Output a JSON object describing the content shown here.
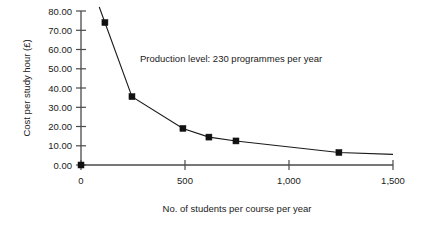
{
  "chart_data": {
    "type": "line",
    "title": "",
    "subtitle": "",
    "xlabel": "No. of students per course per year",
    "ylabel": "Cost per study hour (£)",
    "xlim": [
      0,
      1500
    ],
    "ylim": [
      0,
      80
    ],
    "grid": false,
    "legend": null,
    "annotations": [
      {
        "text": "Production level: 230 programmes per year",
        "x": 330,
        "y": 57
      }
    ],
    "xticks": [
      0,
      500,
      1000,
      1500
    ],
    "xticklabels": [
      "0",
      "500",
      "1,000",
      "1,500"
    ],
    "yticks": [
      0,
      10,
      20,
      30,
      40,
      50,
      60,
      70,
      80
    ],
    "yticklabels": [
      "0.00",
      "10.00",
      "20.00",
      "30.00",
      "40.00",
      "50.00",
      "60.00",
      "70.00",
      "80.00"
    ],
    "series": [
      {
        "name": "Cost per study hour",
        "marker": "square",
        "color": "#111111",
        "x": [
          0,
          115,
          245,
          490,
          615,
          745,
          1240,
          1500
        ],
        "y": [
          0,
          74.0,
          35.5,
          19.0,
          14.5,
          12.5,
          6.5,
          5.5
        ],
        "points": [
          {
            "x": 0,
            "y": 0.0,
            "marker": true
          },
          {
            "x": 115,
            "y": 74.0,
            "marker": true
          },
          {
            "x": 245,
            "y": 35.5,
            "marker": true
          },
          {
            "x": 490,
            "y": 19.0,
            "marker": true
          },
          {
            "x": 615,
            "y": 14.5,
            "marker": true
          },
          {
            "x": 745,
            "y": 12.5,
            "marker": true
          },
          {
            "x": 1240,
            "y": 6.5,
            "marker": true
          },
          {
            "x": 1500,
            "y": 5.5,
            "marker": false
          }
        ]
      }
    ]
  },
  "labels": {
    "y_axis_title": "Cost per study hour (£)",
    "x_axis_title": "No. of students per course per year",
    "annotation": "Production level: 230 programmes per year",
    "ytick_0": "0.00",
    "ytick_10": "10.00",
    "ytick_20": "20.00",
    "ytick_30": "30.00",
    "ytick_40": "40.00",
    "ytick_50": "50.00",
    "ytick_60": "60.00",
    "ytick_70": "70.00",
    "ytick_80": "80.00",
    "xtick_0": "0",
    "xtick_500": "500",
    "xtick_1000": "1,000",
    "xtick_1500": "1,500"
  },
  "colors": {
    "axis": "#4a4a4a",
    "series": "#111111",
    "text": "#1a1a1a",
    "background": "#ffffff"
  }
}
